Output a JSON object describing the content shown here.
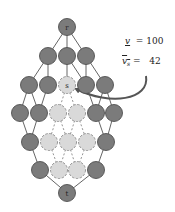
{
  "diagram": {
    "type": "lattice-graph",
    "colors": {
      "node_dark_fill": "#7b7b7b",
      "node_dark_stroke": "#505050",
      "node_light_fill": "#d9d9d9",
      "node_light_stroke": "#8a8a8a",
      "edge_solid": "#666666",
      "edge_dashed": "#8a8a8a",
      "arrow": "#555555"
    },
    "node_radius": 8.5,
    "nodes": [
      {
        "id": "r",
        "label": "r",
        "x": 67,
        "y": 27,
        "style": "dark"
      },
      {
        "id": "a1",
        "label": "",
        "x": 48,
        "y": 56,
        "style": "dark"
      },
      {
        "id": "a2",
        "label": "",
        "x": 67,
        "y": 56,
        "style": "dark"
      },
      {
        "id": "a3",
        "label": "",
        "x": 86,
        "y": 56,
        "style": "dark"
      },
      {
        "id": "b1",
        "label": "",
        "x": 29,
        "y": 85,
        "style": "dark"
      },
      {
        "id": "b2",
        "label": "",
        "x": 48,
        "y": 85,
        "style": "dark"
      },
      {
        "id": "s",
        "label": "s",
        "x": 67,
        "y": 85,
        "style": "light"
      },
      {
        "id": "b4",
        "label": "",
        "x": 86,
        "y": 85,
        "style": "dark"
      },
      {
        "id": "b5",
        "label": "",
        "x": 105,
        "y": 85,
        "style": "dark"
      },
      {
        "id": "c1",
        "label": "",
        "x": 20,
        "y": 113,
        "style": "dark"
      },
      {
        "id": "c2",
        "label": "",
        "x": 39,
        "y": 113,
        "style": "dark"
      },
      {
        "id": "c3",
        "label": "",
        "x": 58,
        "y": 113,
        "style": "light"
      },
      {
        "id": "c4",
        "label": "",
        "x": 77,
        "y": 113,
        "style": "light"
      },
      {
        "id": "c5",
        "label": "",
        "x": 96,
        "y": 113,
        "style": "dark"
      },
      {
        "id": "c6",
        "label": "",
        "x": 114,
        "y": 113,
        "style": "dark"
      },
      {
        "id": "d1",
        "label": "",
        "x": 30,
        "y": 142,
        "style": "dark"
      },
      {
        "id": "d2",
        "label": "",
        "x": 49,
        "y": 142,
        "style": "light"
      },
      {
        "id": "d3",
        "label": "",
        "x": 68,
        "y": 142,
        "style": "light"
      },
      {
        "id": "d4",
        "label": "",
        "x": 87,
        "y": 142,
        "style": "light"
      },
      {
        "id": "d5",
        "label": "",
        "x": 106,
        "y": 142,
        "style": "dark"
      },
      {
        "id": "e1",
        "label": "",
        "x": 40,
        "y": 170,
        "style": "dark"
      },
      {
        "id": "e2",
        "label": "",
        "x": 59,
        "y": 170,
        "style": "light"
      },
      {
        "id": "e3",
        "label": "",
        "x": 77,
        "y": 170,
        "style": "light"
      },
      {
        "id": "e4",
        "label": "",
        "x": 96,
        "y": 170,
        "style": "dark"
      },
      {
        "id": "t",
        "label": "t",
        "x": 67,
        "y": 193,
        "style": "dark"
      }
    ],
    "edges": [
      [
        "r",
        "a1",
        "solid"
      ],
      [
        "r",
        "a2",
        "solid"
      ],
      [
        "r",
        "a3",
        "solid"
      ],
      [
        "a1",
        "b1",
        "solid"
      ],
      [
        "a1",
        "b2",
        "solid"
      ],
      [
        "a2",
        "s",
        "solid"
      ],
      [
        "a3",
        "b4",
        "solid"
      ],
      [
        "a3",
        "b5",
        "solid"
      ],
      [
        "a2",
        "b4",
        "solid"
      ],
      [
        "b1",
        "c1",
        "solid"
      ],
      [
        "b1",
        "c2",
        "solid"
      ],
      [
        "b2",
        "c2",
        "solid"
      ],
      [
        "b4",
        "c5",
        "solid"
      ],
      [
        "b5",
        "c5",
        "solid"
      ],
      [
        "b5",
        "c6",
        "solid"
      ],
      [
        "s",
        "c3",
        "dashed"
      ],
      [
        "s",
        "c4",
        "dashed"
      ],
      [
        "c1",
        "d1",
        "solid"
      ],
      [
        "c2",
        "d1",
        "solid"
      ],
      [
        "c5",
        "d5",
        "solid"
      ],
      [
        "c6",
        "d5",
        "solid"
      ],
      [
        "c3",
        "d2",
        "dashed"
      ],
      [
        "c3",
        "d3",
        "dashed"
      ],
      [
        "c4",
        "d3",
        "dashed"
      ],
      [
        "c4",
        "d4",
        "dashed"
      ],
      [
        "d1",
        "e1",
        "solid"
      ],
      [
        "d5",
        "e4",
        "solid"
      ],
      [
        "d2",
        "e2",
        "dashed"
      ],
      [
        "d3",
        "e2",
        "dashed"
      ],
      [
        "d3",
        "e3",
        "dashed"
      ],
      [
        "d4",
        "e3",
        "dashed"
      ],
      [
        "e1",
        "t",
        "solid"
      ],
      [
        "e4",
        "t",
        "solid"
      ]
    ],
    "annotation": {
      "line1": {
        "symbol": "v",
        "decoration": "underline",
        "subscript": "",
        "eq": "=",
        "value": "100"
      },
      "line2": {
        "symbol": "v",
        "decoration": "overline",
        "subscript": "s",
        "eq": "=",
        "value": "42"
      },
      "arrow_target": "s"
    }
  }
}
